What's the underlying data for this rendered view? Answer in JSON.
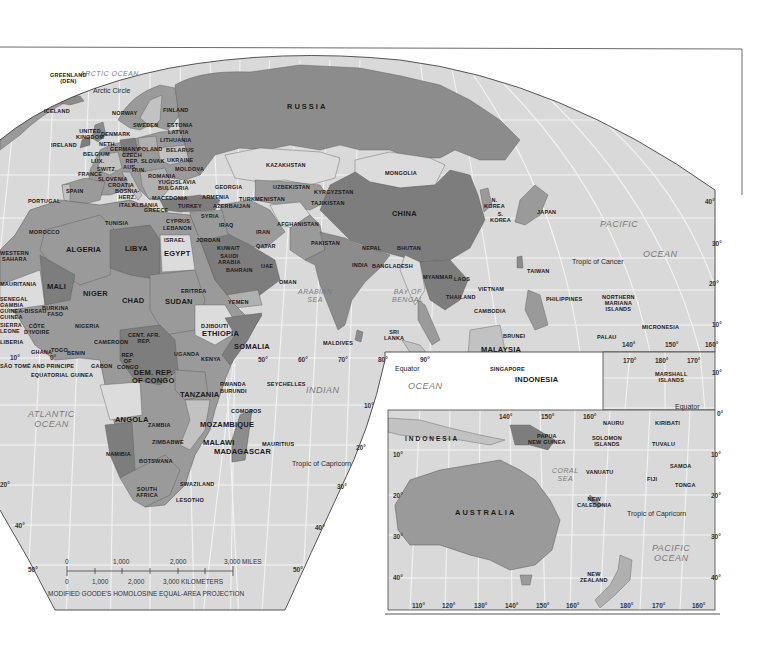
{
  "map": {
    "projection_caption": "MODIFIED GOODE'S HOMOLOSINE EQUAL-AREA PROJECTION",
    "colors": {
      "ocean": "#d9d9d9",
      "graticule": "#f4f4f4",
      "land_dark": "#7d7d7d",
      "land_mid": "#9a9a9a",
      "land_light": "#c2c2c2",
      "land_pale": "#dcdcdc",
      "border": "#333333",
      "background": "#ffffff"
    },
    "scale_bar": {
      "miles_ticks": [
        "0",
        "1,000",
        "2,000",
        "3,000 MILES"
      ],
      "km_ticks": [
        "0",
        "1,000",
        "2,000",
        "3,000 KILOMETERS"
      ]
    },
    "oceans": {
      "arctic": "ARCTIC OCEAN",
      "atlantic": "ATLANTIC\nOCEAN",
      "indian": "INDIAN",
      "indian_ocean": "OCEAN",
      "arabian_sea": "ARABIAN\nSEA",
      "bay_of_bengal": "BAY OF\nBENGAL",
      "pacific": "PACIFIC",
      "pacific_ocean": "OCEAN",
      "coral_sea": "CORAL\nSEA",
      "pacific_inset": "PACIFIC\nOCEAN"
    },
    "lines": {
      "arctic_circle": "Arctic Circle",
      "tropic_of_cancer": "Tropic of Cancer",
      "equator": "Equator",
      "equator_inset": "Equator",
      "tropic_of_capricorn": "Tropic of Capricorn",
      "tropic_of_capricorn_inset": "Tropic of Capricorn"
    },
    "countries": {
      "greenland": "GREENLAND\n(DEN)",
      "iceland": "ICELAND",
      "norway": "NORWAY",
      "finland": "FINLAND",
      "sweden": "SWEDEN",
      "estonia": "ESTONIA",
      "latvia": "LATVIA",
      "lithuania": "LITHUANIA",
      "uk": "UNITED\nKINGDOM",
      "denmark": "DENMARK",
      "ireland": "IRELAND",
      "neth": "NETH.",
      "germany": "GERMANY",
      "poland": "POLAND",
      "belarus": "BELARUS",
      "belgium": "BELGIUM",
      "lux": "LUX.",
      "czech": "CZECH\nREP.",
      "slovak": "SLOVAK",
      "ukraine": "UKRAINE",
      "france": "FRANCE",
      "switz": "SWITZ.",
      "aus": "AUS.",
      "hun": "HUN.",
      "moldova": "MOLDOVA",
      "slovenia": "SLOVENIA",
      "romania": "ROMANIA",
      "croatia": "CROATIA",
      "yugoslavia": "YUGOSLAVIA",
      "bosnia": "BOSNIA-\nHERZ.",
      "bulgaria": "BULGARIA",
      "spain": "SPAIN",
      "portugal": "PORTUGAL",
      "italy": "ITALY",
      "albania": "ALBANIA",
      "macedonia": "MACEDONIA",
      "greece": "GREECE",
      "turkey": "TURKEY",
      "georgia": "GEORGIA",
      "armenia": "ARMENIA",
      "azerbaijan": "AZERBAIJAN",
      "russia": "RUSSIA",
      "kazakhstan": "KAZAKHSTAN",
      "mongolia": "MONGOLIA",
      "uzbekistan": "UZBEKISTAN",
      "kyrgyzstan": "KYRGYZSTAN",
      "turkmenistan": "TURKMENISTAN",
      "tajikistan": "TAJIKISTAN",
      "china": "CHINA",
      "n_korea": "N.\nKOREA",
      "s_korea": "S.\nKOREA",
      "japan": "JAPAN",
      "morocco": "MOROCCO",
      "tunisia": "TUNISIA",
      "cyprus": "CYPRUS",
      "lebanon": "LEBANON",
      "syria": "SYRIA",
      "iraq": "IRAQ",
      "iran": "IRAN",
      "afghanistan": "AFGHANISTAN",
      "pakistan": "PAKISTAN",
      "israel": "ISRAEL",
      "jordan": "JORDAN",
      "kuwait": "KUWAIT",
      "qatar": "QATAR",
      "saudi_arabia": "SAUDI\nARABIA",
      "bahrain": "BAHRAIN",
      "uae": "UAE",
      "oman": "OMAN",
      "yemen": "YEMEN",
      "nepal": "NEPAL",
      "bhutan": "BHUTAN",
      "india": "INDIA",
      "bangladesh": "BANGLADESH",
      "myanmar": "MYANMAR",
      "laos": "LAOS",
      "vietnam": "VIETNAM",
      "thailand": "THAILAND",
      "cambodia": "CAMBODIA",
      "taiwan": "TAIWAN",
      "philippines": "PHILIPPINES",
      "n_mariana": "NORTHERN\nMARIANA\nISLANDS",
      "micronesia": "MICRONESIA",
      "palau": "PALAU",
      "sri_lanka": "SRI\nLANKA",
      "maldives": "MALDIVES",
      "brunei": "BRUNEI",
      "malaysia": "MALAYSIA",
      "singapore": "SINGAPORE",
      "indonesia": "INDONESIA",
      "western_sahara": "WESTERN\nSAHARA",
      "algeria": "ALGERIA",
      "libya": "LIBYA",
      "egypt": "EGYPT",
      "mauritania": "MAURITANIA",
      "mali": "MALI",
      "niger": "NIGER",
      "chad": "CHAD",
      "sudan": "SUDAN",
      "eritrea": "ERITREA",
      "senegal": "SENEGAL\nGAMBIA\nGUINEA-BISSAU\nGUINEA",
      "sierra_leone": "SIERRA\nLEONE",
      "liberia": "LIBERIA",
      "burkina_faso": "BURKINA\nFASO",
      "cote_divoire": "CÔTE\nD'IVOIRE",
      "nigeria": "NIGERIA",
      "ghana": "GHANA",
      "togo": "TOGO",
      "benin": "BENIN",
      "cameroon": "CAMEROON",
      "car": "CENT. AFR.\nREP.",
      "djibouti": "DJIBOUTI",
      "ethiopia": "ETHIOPIA",
      "somalia": "SOMALIA",
      "sao_tome": "SÃO TOMÉ AND PRINCIPE",
      "equatorial_guinea": "EQUATORIAL GUINEA",
      "gabon": "GABON",
      "rep_congo": "REP.\nOF\nCONGO",
      "drc": "DEM. REP.\nOF CONGO",
      "uganda": "UGANDA",
      "kenya": "KENYA",
      "rwanda": "RWANDA",
      "burundi": "BURUNDI",
      "tanzania": "TANZANIA",
      "seychelles": "SEYCHELLES",
      "comoros": "COMOROS",
      "angola": "ANGOLA",
      "zambia": "ZAMBIA",
      "mozambique": "MOZAMBIQUE",
      "malawi": "MALAWI",
      "zimbabwe": "ZIMBABWE",
      "namibia": "NAMIBIA",
      "botswana": "BOTSWANA",
      "madagascar": "MADAGASCAR",
      "mauritius": "MAURITIUS",
      "swaziland": "SWAZILAND",
      "south_africa": "SOUTH\nAFRICA",
      "lesotho": "LESOTHO",
      "marshall": "MARSHALL\nISLANDS",
      "nauru": "NAURU",
      "kiribati": "KIRIBATI",
      "png": "PAPUA\nNEW GUINEA",
      "solomon": "SOLOMON\nISLANDS",
      "tuvalu": "TUVALU",
      "indonesia_inset": "INDONESIA",
      "samoa": "SAMOA",
      "vanuatu": "VANUATU",
      "fiji": "FIJI",
      "tonga": "TONGA",
      "new_caledonia": "NEW\nCALEDONIA",
      "australia": "AUSTRALIA",
      "new_zealand": "NEW\nZEALAND"
    },
    "degrees": {
      "lon_main": [
        "10°",
        "0°",
        "50°",
        "60°",
        "70°",
        "80°",
        "90°"
      ],
      "lat_left": [
        "20°",
        "40°",
        "50°"
      ],
      "lat_right_africa": [
        "10°",
        "20°",
        "30°",
        "40°",
        "50°"
      ],
      "lat_pacific": [
        "40°",
        "30°",
        "20°",
        "10°"
      ],
      "lon_pacific": [
        "140°",
        "150°",
        "160°"
      ],
      "lon_inset_top": [
        "170°",
        "180°",
        "170°"
      ],
      "lat_inset_top": [
        "10°",
        "0°"
      ],
      "lon_aus_top": [
        "140°",
        "150°",
        "160°"
      ],
      "lat_aus_left": [
        "10°",
        "20°",
        "30°",
        "40°"
      ],
      "lat_aus_right": [
        "10°",
        "20°",
        "30°",
        "40°"
      ],
      "lon_aus_bottom": [
        "110°",
        "120°",
        "130°",
        "140°",
        "150°",
        "160°",
        "180°",
        "170°",
        "160°"
      ]
    }
  }
}
